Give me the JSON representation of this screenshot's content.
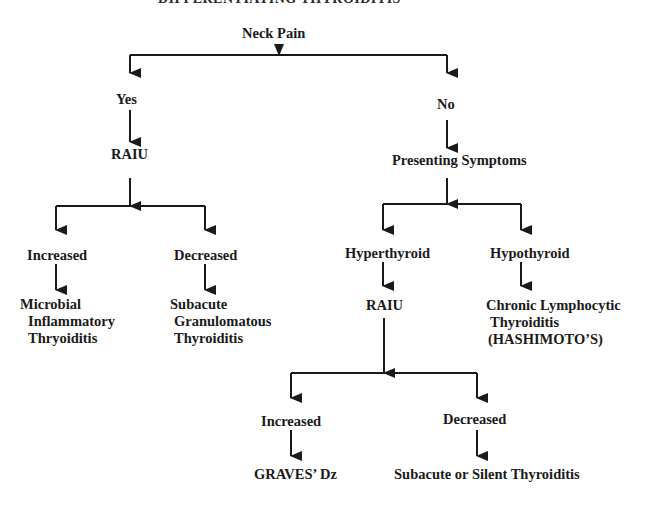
{
  "diagram": {
    "title": "DIFFERENTIATING THYROIDITIS",
    "colors": {
      "line": "#1a1a1a",
      "text": "#1a1a1a",
      "background": "#ffffff"
    },
    "nodes": {
      "neck_pain": "Neck Pain",
      "yes": "Yes",
      "no": "No",
      "raiu_left": "RAIU",
      "presenting_symptoms": "Presenting Symptoms",
      "left_increased": "Increased",
      "left_decreased": "Decreased",
      "hyperthyroid": "Hyperthyroid",
      "hypothyroid": "Hypothyroid",
      "microbial": {
        "line1": "Microbial",
        "line2": "Inflammatory",
        "line3": "Thryoiditis"
      },
      "subacute_granulomatous": {
        "line1": "Subacute",
        "line2": "Granulomatous",
        "line3": "Thyroiditis"
      },
      "raiu_right": "RAIU",
      "hashimoto": {
        "line1": "Chronic Lymphocytic",
        "line2": "Thyroiditis",
        "line3": "(HASHIMOTO’S)"
      },
      "right_increased": "Increased",
      "right_decreased": "Decreased",
      "graves": "GRAVES’ Dz",
      "subacute_silent": "Subacute or Silent Thyroiditis"
    },
    "edges": [
      {
        "from": "Neck Pain",
        "to": "Yes"
      },
      {
        "from": "Neck Pain",
        "to": "No"
      },
      {
        "from": "Yes",
        "to": "RAIU"
      },
      {
        "from": "No",
        "to": "Presenting Symptoms"
      },
      {
        "from": "RAIU",
        "to": "Increased"
      },
      {
        "from": "RAIU",
        "to": "Decreased"
      },
      {
        "from": "Increased",
        "to": "Microbial Inflammatory Thryoiditis"
      },
      {
        "from": "Decreased",
        "to": "Subacute Granulomatous Thyroiditis"
      },
      {
        "from": "Presenting Symptoms",
        "to": "Hyperthyroid"
      },
      {
        "from": "Presenting Symptoms",
        "to": "Hypothyroid"
      },
      {
        "from": "Hyperthyroid",
        "to": "RAIU"
      },
      {
        "from": "Hypothyroid",
        "to": "Chronic Lymphocytic Thyroiditis (HASHIMOTO'S)"
      },
      {
        "from": "RAIU",
        "to": "Increased"
      },
      {
        "from": "RAIU",
        "to": "Decreased"
      },
      {
        "from": "Increased",
        "to": "GRAVES' Dz"
      },
      {
        "from": "Decreased",
        "to": "Subacute or Silent Thyroiditis"
      }
    ]
  }
}
